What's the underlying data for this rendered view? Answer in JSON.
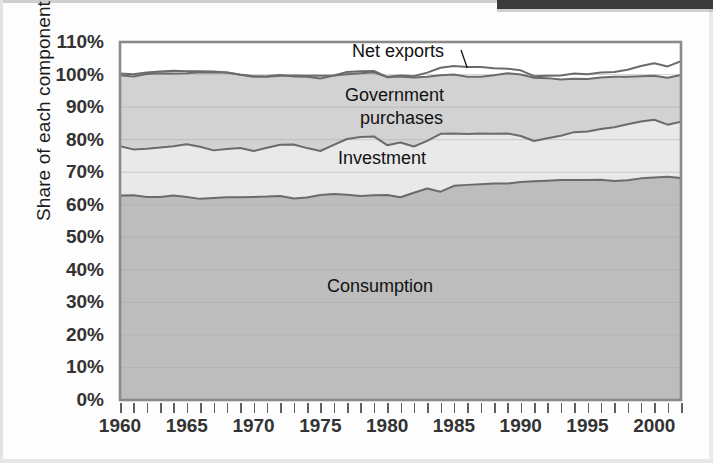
{
  "chart_data": {
    "type": "area",
    "stacked": true,
    "title": "",
    "subtitle": "",
    "xlabel": "",
    "ylabel": "Share of each component",
    "ylim": [
      0,
      110
    ],
    "xlim": [
      1960,
      2002
    ],
    "grid": true,
    "grid_axis": "y",
    "legend_position": "inline-annotations",
    "ytick_labels": [
      "0%",
      "10%",
      "20%",
      "30%",
      "40%",
      "50%",
      "60%",
      "70%",
      "80%",
      "90%",
      "100%",
      "110%"
    ],
    "ytick_values": [
      0,
      10,
      20,
      30,
      40,
      50,
      60,
      70,
      80,
      90,
      100,
      110
    ],
    "xtick_labels": [
      "1960",
      "1965",
      "1970",
      "1975",
      "1980",
      "1985",
      "1990",
      "1995",
      "2000"
    ],
    "xtick_values": [
      1960,
      1965,
      1970,
      1975,
      1980,
      1985,
      1990,
      1995,
      2000
    ],
    "minor_xticks_every": 1,
    "x": [
      1960,
      1961,
      1962,
      1963,
      1964,
      1965,
      1966,
      1967,
      1968,
      1969,
      1970,
      1971,
      1972,
      1973,
      1974,
      1975,
      1976,
      1977,
      1978,
      1979,
      1980,
      1981,
      1982,
      1983,
      1984,
      1985,
      1986,
      1987,
      1988,
      1989,
      1990,
      1991,
      1992,
      1993,
      1994,
      1995,
      1996,
      1997,
      1998,
      1999,
      2000,
      2001,
      2002
    ],
    "series": [
      {
        "name": "Consumption",
        "color": "#bdbdbd",
        "label_x": 1977,
        "label_y": 33,
        "values": [
          62.8,
          62.9,
          62.4,
          62.4,
          62.8,
          62.4,
          61.8,
          62.1,
          62.3,
          62.3,
          62.4,
          62.5,
          62.7,
          61.9,
          62.2,
          63.0,
          63.3,
          63.1,
          62.7,
          62.9,
          63.0,
          62.3,
          63.7,
          65.0,
          64.0,
          65.8,
          66.1,
          66.3,
          66.5,
          66.5,
          67.0,
          67.2,
          67.4,
          67.6,
          67.6,
          67.6,
          67.7,
          67.3,
          67.5,
          68.1,
          68.4,
          68.6,
          68.2
        ]
      },
      {
        "name": "Investment",
        "color": "#e9e9e9",
        "label_x": 1977,
        "label_y": 74,
        "values": [
          15.2,
          14.1,
          14.8,
          15.2,
          15.2,
          16.2,
          16.0,
          14.6,
          14.8,
          15.1,
          14.1,
          15.0,
          15.7,
          16.6,
          15.2,
          13.5,
          15.1,
          17.1,
          18.1,
          18.1,
          15.3,
          16.8,
          14.2,
          14.6,
          17.8,
          16.1,
          15.6,
          15.6,
          15.3,
          15.4,
          14.1,
          12.4,
          13.0,
          13.6,
          14.7,
          14.9,
          15.6,
          16.5,
          17.2,
          17.5,
          17.7,
          16.0,
          17.3
        ]
      },
      {
        "name": "Government purchases",
        "color": "#d2d2d2",
        "label_x": 1977,
        "label_y": 90,
        "values": [
          21.8,
          22.4,
          23.0,
          22.8,
          22.3,
          21.8,
          22.9,
          23.9,
          23.5,
          22.5,
          22.8,
          22.0,
          21.5,
          20.9,
          21.9,
          22.3,
          21.3,
          20.6,
          20.2,
          20.1,
          21.0,
          20.6,
          21.6,
          21.0,
          20.3,
          20.7,
          20.6,
          20.4,
          20.1,
          19.9,
          20.2,
          19.9,
          19.2,
          18.5,
          18.0,
          17.6,
          17.3,
          17.0,
          16.8,
          17.0,
          17.4,
          17.9,
          18.6
        ]
      },
      {
        "name": "Net exports",
        "color": "#ffffff",
        "label_x": 1978,
        "label_y": 107,
        "values": [
          0.5,
          0.7,
          0.4,
          0.5,
          0.9,
          0.6,
          0.3,
          0.3,
          0.0,
          0.1,
          0.2,
          -0.2,
          -0.3,
          0.3,
          0.3,
          0.8,
          0.0,
          -0.7,
          -0.6,
          -0.4,
          -0.1,
          -0.3,
          -0.4,
          -1.3,
          -2.3,
          -2.6,
          -3.0,
          -3.0,
          -2.1,
          -1.4,
          -1.3,
          -0.5,
          -0.7,
          -1.2,
          -1.6,
          -1.5,
          -1.5,
          -1.5,
          -2.2,
          -3.1,
          -3.9,
          -3.5,
          -4.2
        ]
      }
    ],
    "annotations": [
      {
        "text": "Net exports",
        "leader_line": true,
        "target_x": 1986,
        "target_y": 102
      },
      {
        "text": "Government",
        "leader_line": false
      },
      {
        "text": "purchases",
        "leader_line": false
      },
      {
        "text": "Investment",
        "leader_line": false
      },
      {
        "text": "Consumption",
        "leader_line": false
      }
    ],
    "labels": {
      "net_exports": "Net exports",
      "government_line1": "Government",
      "government_line2": "purchases",
      "investment": "Investment",
      "consumption": "Consumption"
    },
    "colors": {
      "consumption": "#bdbdbd",
      "investment": "#e9e9e9",
      "government": "#d2d2d2",
      "net_exports": "#ffffff",
      "line": "#6b6b6b",
      "axis": "#8a8a8a",
      "grid": "#a9a9a9",
      "text": "#333333",
      "header_bar": "#3a3a3a"
    }
  }
}
